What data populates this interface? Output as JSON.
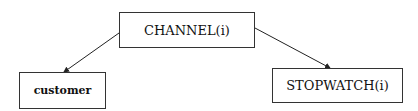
{
  "diagram": {
    "type": "tree",
    "nodes": [
      {
        "id": "channel",
        "label": "CHANNEL(i)"
      },
      {
        "id": "customer",
        "label": "customer"
      },
      {
        "id": "stopwatch",
        "label": "STOPWATCH(i)"
      }
    ],
    "edges": [
      {
        "from": "channel",
        "to": "customer"
      },
      {
        "from": "channel",
        "to": "stopwatch"
      }
    ]
  }
}
